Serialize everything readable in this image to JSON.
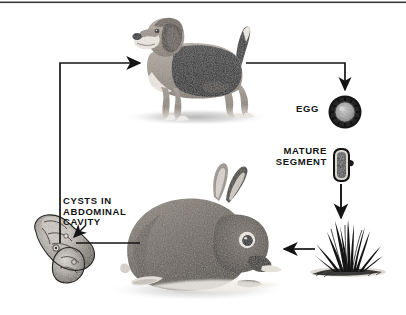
{
  "diagram": {
    "background_color": "#ffffff",
    "ink_color": "#141414",
    "top_rule": true,
    "labels": {
      "egg": "EGG",
      "mature_segment": "MATURE\nSEGMENT",
      "cysts": "CYSTS IN\nABDOMINAL\nCAVITY"
    },
    "stages": [
      {
        "name": "dog",
        "caption": "",
        "position": "top-center"
      },
      {
        "name": "egg",
        "caption": "EGG",
        "position": "right-upper"
      },
      {
        "name": "mature-segment",
        "caption": "MATURE SEGMENT",
        "position": "right-middle"
      },
      {
        "name": "grass",
        "caption": "",
        "position": "right-lower"
      },
      {
        "name": "rabbit",
        "caption": "",
        "position": "bottom-center"
      },
      {
        "name": "cysts",
        "caption": "CYSTS IN ABDOMINAL CAVITY",
        "position": "left-lower"
      }
    ],
    "arrows": [
      {
        "from": "cysts",
        "to": "dog",
        "style": "elbow-up-right",
        "head": true
      },
      {
        "from": "dog",
        "to": "egg",
        "style": "elbow-right-down",
        "head": true
      },
      {
        "from": "mature-segment",
        "to": "grass",
        "style": "straight-down",
        "head": true
      },
      {
        "from": "grass",
        "to": "rabbit",
        "style": "straight-left",
        "head": true
      },
      {
        "from": "rabbit",
        "to": "cysts",
        "style": "straight-left",
        "head": false
      }
    ]
  }
}
